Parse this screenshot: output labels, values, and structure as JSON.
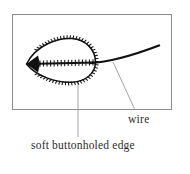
{
  "figure": {
    "type": "technical-illustration",
    "frame": {
      "border_color": "#8c8c8c",
      "fill_color": "#ffffff",
      "x": 12,
      "y": 14,
      "width": 160,
      "height": 96
    },
    "ink_color": "#111111",
    "leader_line_color": "#9a9a9a",
    "leaf": {
      "name": "soft-buttonholed-leaf-shape",
      "tip_x": 26,
      "tip_y": 64,
      "right_x": 95,
      "top_y": 39,
      "bottom_y": 81,
      "stitch_count": 60,
      "vein_tick_count": 16
    },
    "wire": {
      "name": "wire-curve",
      "start_x": 26,
      "start_y": 64,
      "end_x": 159,
      "end_y": 45
    },
    "leaders": [
      {
        "name": "leader-to-wire",
        "x1": 135,
        "y1": 110,
        "x2": 113,
        "y2": 62
      },
      {
        "name": "leader-to-edge",
        "x1": 78,
        "y1": 137,
        "x2": 78,
        "y2": 80
      }
    ]
  },
  "labels": {
    "wire": "wire",
    "edge": "soft buttonholed edge"
  }
}
